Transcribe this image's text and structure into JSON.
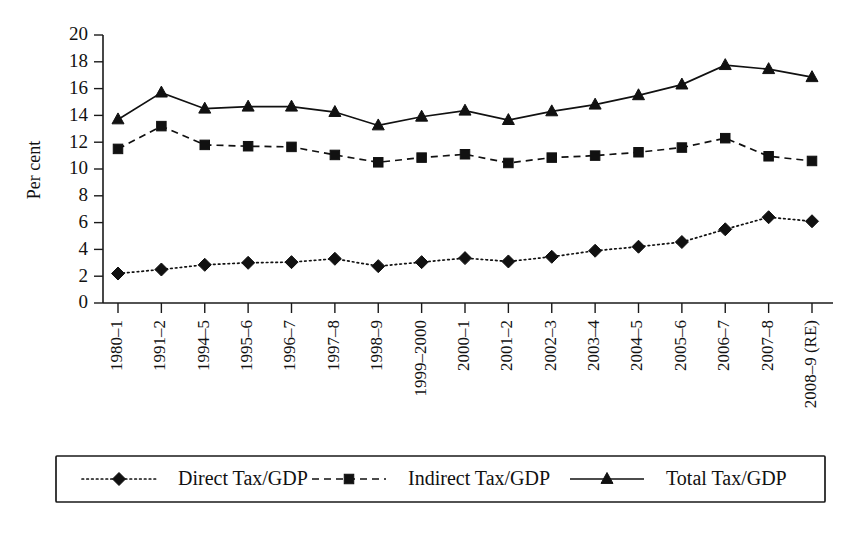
{
  "chart_data": {
    "type": "line",
    "title": "",
    "subtitle": "",
    "xlabel": "",
    "ylabel": "Per cent",
    "ylim": [
      0,
      20
    ],
    "ytick_step": 2,
    "yticks": [
      0,
      2,
      4,
      6,
      8,
      10,
      12,
      14,
      16,
      18,
      20
    ],
    "grid": false,
    "legend_position": "bottom",
    "categories": [
      "1980–1",
      "1991–2",
      "1994–5",
      "1995–6",
      "1996–7",
      "1997–8",
      "1998–9",
      "1999–2000",
      "2000–1",
      "2001–2",
      "2002–3",
      "2003–4",
      "2004–5",
      "2005–6",
      "2006–7",
      "2007–8",
      "2008–9 (RE)"
    ],
    "series": [
      {
        "name": "Direct Tax/GDP",
        "marker": "diamond",
        "line_style": "dotted",
        "color": "#111111",
        "values": [
          2.2,
          2.5,
          2.85,
          3.0,
          3.05,
          3.3,
          2.75,
          3.05,
          3.35,
          3.1,
          3.45,
          3.9,
          4.2,
          4.55,
          5.5,
          6.4,
          6.1
        ]
      },
      {
        "name": "Indirect Tax/GDP",
        "marker": "square",
        "line_style": "dashed",
        "color": "#111111",
        "values": [
          11.5,
          13.2,
          11.8,
          11.7,
          11.65,
          11.05,
          10.5,
          10.85,
          11.1,
          10.45,
          10.85,
          11.0,
          11.25,
          11.6,
          12.3,
          10.95,
          10.6
        ]
      },
      {
        "name": "Total Tax/GDP",
        "marker": "triangle",
        "line_style": "solid",
        "color": "#111111",
        "values": [
          13.7,
          15.7,
          14.5,
          14.65,
          14.65,
          14.25,
          13.25,
          13.9,
          14.35,
          13.65,
          14.3,
          14.8,
          15.5,
          16.3,
          17.75,
          17.45,
          16.85
        ]
      }
    ]
  },
  "legend": {
    "entries": [
      {
        "label": "Direct Tax/GDP",
        "marker": "diamond",
        "line_style": "dotted"
      },
      {
        "label": "Indirect Tax/GDP",
        "marker": "square",
        "line_style": "dashed"
      },
      {
        "label": "Total Tax/GDP",
        "marker": "triangle",
        "line_style": "solid"
      }
    ]
  },
  "colors": {
    "ink": "#111111",
    "axis": "#1a1a1a",
    "background": "#ffffff"
  }
}
